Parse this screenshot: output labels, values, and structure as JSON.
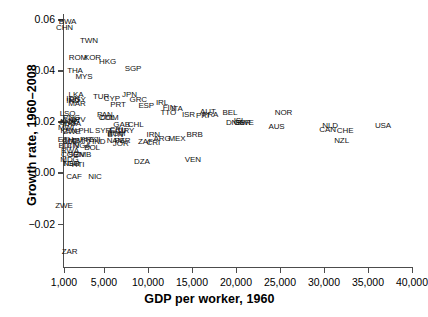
{
  "chart_data": {
    "type": "scatter",
    "title": "",
    "xlabel": "GDP per worker, 1960",
    "ylabel": "Growth rate, 1960–2008",
    "xlim": [
      1000,
      40000
    ],
    "ylim": [
      -0.037,
      0.062
    ],
    "xticks": [
      1000,
      5000,
      10000,
      15000,
      20000,
      25000,
      30000,
      35000,
      40000
    ],
    "xticklabels": [
      "1,000",
      "5,000",
      "10,000",
      "15,000",
      "20,000",
      "25,000",
      "30,000",
      "35,000",
      "40,000"
    ],
    "yticks": [
      -0.02,
      0.0,
      0.02,
      0.04,
      0.06
    ],
    "yticklabels": [
      "−0.02",
      "0.00",
      "0.02",
      "0.04",
      "0.06"
    ],
    "grid": false,
    "legend": null,
    "marker_style": "text-label",
    "points": [
      {
        "label": "BWA",
        "x": 1350,
        "y": 0.059
      },
      {
        "label": "CHN",
        "x": 1050,
        "y": 0.0565
      },
      {
        "label": "TWN",
        "x": 3500,
        "y": 0.0513
      },
      {
        "label": "ROM",
        "x": 2400,
        "y": 0.0446
      },
      {
        "label": "KOR",
        "x": 3850,
        "y": 0.0446
      },
      {
        "label": "HKG",
        "x": 5400,
        "y": 0.0432
      },
      {
        "label": "SGP",
        "x": 8300,
        "y": 0.0406
      },
      {
        "label": "THA",
        "x": 2100,
        "y": 0.0398
      },
      {
        "label": "MYS",
        "x": 3000,
        "y": 0.0375
      },
      {
        "label": "LKA",
        "x": 2200,
        "y": 0.0302
      },
      {
        "label": "JPN",
        "x": 7900,
        "y": 0.0305
      },
      {
        "label": "TUR",
        "x": 4700,
        "y": 0.0296
      },
      {
        "label": "CYP",
        "x": 5900,
        "y": 0.0288
      },
      {
        "label": "GRC",
        "x": 8900,
        "y": 0.0283
      },
      {
        "label": "IDN",
        "x": 1900,
        "y": 0.0286
      },
      {
        "label": "IND",
        "x": 1900,
        "y": 0.0279
      },
      {
        "label": "EGY",
        "x": 2350,
        "y": 0.0282
      },
      {
        "label": "MAR",
        "x": 2300,
        "y": 0.0267
      },
      {
        "label": "PRT",
        "x": 6600,
        "y": 0.0263
      },
      {
        "label": "ESP",
        "x": 9800,
        "y": 0.026
      },
      {
        "label": "IRL",
        "x": 11600,
        "y": 0.0272
      },
      {
        "label": "FIN",
        "x": 12400,
        "y": 0.0253
      },
      {
        "label": "ITA",
        "x": 13300,
        "y": 0.0248
      },
      {
        "label": "TTO",
        "x": 12300,
        "y": 0.0233
      },
      {
        "label": "AUT",
        "x": 16800,
        "y": 0.0238
      },
      {
        "label": "ISR",
        "x": 14600,
        "y": 0.0225
      },
      {
        "label": "FRA",
        "x": 17100,
        "y": 0.0223
      },
      {
        "label": "PRI",
        "x": 16200,
        "y": 0.022
      },
      {
        "label": "BEL",
        "x": 19300,
        "y": 0.0232
      },
      {
        "label": "NOR",
        "x": 25400,
        "y": 0.0232
      },
      {
        "label": "LSO",
        "x": 1350,
        "y": 0.0229
      },
      {
        "label": "PAN",
        "x": 5100,
        "y": 0.0223
      },
      {
        "label": "COL",
        "x": 5300,
        "y": 0.0215
      },
      {
        "label": "DOM",
        "x": 5600,
        "y": 0.0213
      },
      {
        "label": "PNG",
        "x": 1750,
        "y": 0.0213
      },
      {
        "label": "CHN2",
        "x": 1700,
        "y": 0.0203
      },
      {
        "label": "CPV",
        "x": 2350,
        "y": 0.0206
      },
      {
        "label": "GNB",
        "x": 1350,
        "y": 0.0192
      },
      {
        "label": "MOZ",
        "x": 1500,
        "y": 0.0196
      },
      {
        "label": "UGA",
        "x": 1850,
        "y": 0.019
      },
      {
        "label": "GAB",
        "x": 7000,
        "y": 0.0186
      },
      {
        "label": "CHL",
        "x": 8600,
        "y": 0.0186
      },
      {
        "label": "DNK",
        "x": 19800,
        "y": 0.0195
      },
      {
        "label": "GBR",
        "x": 20700,
        "y": 0.0193
      },
      {
        "label": "SWE",
        "x": 21000,
        "y": 0.0192
      },
      {
        "label": "ISL",
        "x": 20400,
        "y": 0.0203
      },
      {
        "label": "AUS",
        "x": 24600,
        "y": 0.0178
      },
      {
        "label": "NLD",
        "x": 30700,
        "y": 0.0183
      },
      {
        "label": "USA",
        "x": 36700,
        "y": 0.0182
      },
      {
        "label": "CAN",
        "x": 30400,
        "y": 0.0168
      },
      {
        "label": "CHE",
        "x": 32400,
        "y": 0.0163
      },
      {
        "label": "MWI",
        "x": 1200,
        "y": 0.0175
      },
      {
        "label": "SYR",
        "x": 4900,
        "y": 0.0164
      },
      {
        "label": "CRI",
        "x": 6400,
        "y": 0.0166
      },
      {
        "label": "ECU",
        "x": 6600,
        "y": 0.0163
      },
      {
        "label": "URY",
        "x": 7500,
        "y": 0.0161
      },
      {
        "label": "PHL",
        "x": 3200,
        "y": 0.0163
      },
      {
        "label": "KEN",
        "x": 1450,
        "y": 0.0163
      },
      {
        "label": "ZWE2",
        "x": 1800,
        "y": 0.0158
      },
      {
        "label": "BGM",
        "x": 6400,
        "y": 0.0151
      },
      {
        "label": "BTN",
        "x": 6300,
        "y": 0.0145
      },
      {
        "label": "IRN",
        "x": 10600,
        "y": 0.0145
      },
      {
        "label": "ARG",
        "x": 11600,
        "y": 0.0131
      },
      {
        "label": "MEX",
        "x": 13300,
        "y": 0.0132
      },
      {
        "label": "BRB",
        "x": 15300,
        "y": 0.0148
      },
      {
        "label": "PRY",
        "x": 3400,
        "y": 0.0128
      },
      {
        "label": "FJI",
        "x": 4100,
        "y": 0.0127
      },
      {
        "label": "HND",
        "x": 4300,
        "y": 0.012
      },
      {
        "label": "NAM",
        "x": 6300,
        "y": 0.0125
      },
      {
        "label": "PER",
        "x": 7100,
        "y": 0.0124
      },
      {
        "label": "JOR",
        "x": 6900,
        "y": 0.0112
      },
      {
        "label": "ZAF",
        "x": 9700,
        "y": 0.0118
      },
      {
        "label": "CRI2",
        "x": 10600,
        "y": 0.0115
      },
      {
        "label": "ETH",
        "x": 1150,
        "y": 0.0126
      },
      {
        "label": "GMB",
        "x": 1700,
        "y": 0.0123
      },
      {
        "label": "CMR",
        "x": 2600,
        "y": 0.0124
      },
      {
        "label": "SLE",
        "x": 1600,
        "y": 0.0118
      },
      {
        "label": "NZL",
        "x": 32000,
        "y": 0.0125
      },
      {
        "label": "BDI",
        "x": 1100,
        "y": 0.0103
      },
      {
        "label": "CIV",
        "x": 1900,
        "y": 0.0102
      },
      {
        "label": "NGA",
        "x": 2800,
        "y": 0.0102
      },
      {
        "label": "BOL",
        "x": 3800,
        "y": 0.0094
      },
      {
        "label": "RWA",
        "x": 1600,
        "y": 0.0084
      },
      {
        "label": "COG",
        "x": 1600,
        "y": 0.007
      },
      {
        "label": "SEN",
        "x": 2200,
        "y": 0.007
      },
      {
        "label": "ZMB",
        "x": 2900,
        "y": 0.0069
      },
      {
        "label": "MDG",
        "x": 1550,
        "y": 0.005
      },
      {
        "label": "TGO",
        "x": 1700,
        "y": 0.0034
      },
      {
        "label": "NER",
        "x": 1750,
        "y": 0.0035
      },
      {
        "label": "HTI",
        "x": 2400,
        "y": 0.003
      },
      {
        "label": "DZA",
        "x": 9300,
        "y": 0.0042
      },
      {
        "label": "VEN",
        "x": 15100,
        "y": 0.0047
      },
      {
        "label": "CAF",
        "x": 2000,
        "y": -0.0016
      },
      {
        "label": "NIC",
        "x": 4100,
        "y": -0.0019
      },
      {
        "label": "ZWE",
        "x": 1000,
        "y": -0.0133
      },
      {
        "label": "ZAR",
        "x": 1550,
        "y": -0.0313
      }
    ]
  }
}
